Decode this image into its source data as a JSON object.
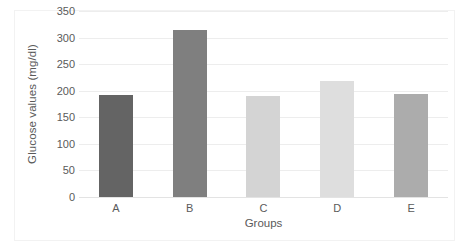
{
  "chart_data": {
    "type": "bar",
    "title": "",
    "categories": [
      "A",
      "B",
      "C",
      "D",
      "E"
    ],
    "values": [
      192,
      315,
      191,
      219,
      193
    ],
    "series": [
      {
        "name": "Glucose values",
        "values": [
          192,
          315,
          191,
          219,
          193
        ]
      }
    ],
    "bar_colors": [
      "#646464",
      "#7f7f7f",
      "#d4d4d4",
      "#dedede",
      "#acacac"
    ],
    "xlabel": "Groups",
    "ylabel": "Glucose values (mg/dl)",
    "ylim": [
      0,
      350
    ],
    "ytick_step": 50,
    "yticks": [
      0,
      50,
      100,
      150,
      200,
      250,
      300,
      350
    ],
    "ytick_labels": [
      "0",
      "50",
      "100",
      "150",
      "200",
      "250",
      "300",
      "350"
    ],
    "grid": true,
    "grid_axis": "y",
    "grid_color": "#ededed",
    "legend": false,
    "legend_position": "none",
    "border_color": "#f2f2f2",
    "background": "#ffffff",
    "text_color": "#5a5a5a"
  }
}
